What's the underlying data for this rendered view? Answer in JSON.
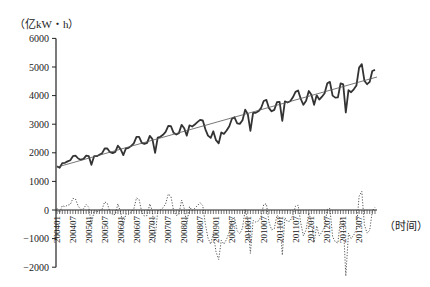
{
  "chart_data": {
    "type": "line",
    "title": "",
    "ylabel": "（亿kW・h）",
    "xlabel": "（时间）",
    "ylim": [
      -2000,
      6000
    ],
    "yticks": [
      6000,
      5000,
      4000,
      3000,
      2000,
      1000,
      0,
      -1000,
      -2000
    ],
    "ytick_labels": [
      "6000",
      "5000",
      "4000",
      "3000",
      "2000",
      "1000",
      "0",
      "−1000",
      "−2000"
    ],
    "x_tick_labels": [
      "200401",
      "200407",
      "200501",
      "200507",
      "200601",
      "200607",
      "200701",
      "200707",
      "200801",
      "200807",
      "200901",
      "200907",
      "201001",
      "201007",
      "201101",
      "201107",
      "201201",
      "201207",
      "201301",
      "201307"
    ],
    "x_start": "2004-01",
    "x_end": "2014-01",
    "grid": false,
    "legend": null,
    "series": [
      {
        "name": "Monthly electricity consumption",
        "style": "solid-thick",
        "values": [
          1530,
          1480,
          1640,
          1650,
          1700,
          1740,
          1880,
          1900,
          1800,
          1760,
          1790,
          1900,
          1880,
          1580,
          1880,
          1880,
          1930,
          1980,
          2150,
          2150,
          2020,
          1990,
          2030,
          2250,
          2130,
          1920,
          2150,
          2170,
          2240,
          2330,
          2560,
          2560,
          2350,
          2310,
          2350,
          2590,
          2480,
          2000,
          2530,
          2560,
          2630,
          2730,
          2940,
          2930,
          2700,
          2640,
          2690,
          2980,
          2860,
          2600,
          2960,
          2920,
          2990,
          3070,
          3150,
          3130,
          2820,
          2600,
          2520,
          2750,
          2440,
          2330,
          2710,
          2660,
          2780,
          2930,
          3190,
          3240,
          3030,
          3010,
          3140,
          3510,
          3350,
          2770,
          3400,
          3400,
          3450,
          3560,
          3810,
          3850,
          3560,
          3450,
          3500,
          3770,
          3780,
          3120,
          3800,
          3760,
          3800,
          3940,
          4130,
          4180,
          3880,
          3680,
          3820,
          4160,
          4030,
          3680,
          4010,
          3860,
          3960,
          4080,
          4430,
          4480,
          4000,
          3930,
          3940,
          4430,
          4390,
          3410,
          4190,
          4120,
          4220,
          4350,
          4980,
          5100,
          4520,
          4400,
          4480,
          4860,
          4900
        ]
      },
      {
        "name": "Linear trend",
        "style": "solid-thin",
        "start": 1500,
        "end": 4650
      },
      {
        "name": "Residual / seasonal component",
        "style": "dotted",
        "values": [
          30,
          -50,
          80,
          60,
          90,
          100,
          210,
          200,
          70,
          10,
          20,
          100,
          50,
          -270,
          -10,
          -30,
          -10,
          10,
          150,
          120,
          -40,
          -90,
          -80,
          110,
          -40,
          -270,
          -70,
          -80,
          -40,
          20,
          220,
          190,
          -40,
          -110,
          -100,
          110,
          -20,
          -520,
          -20,
          0,
          40,
          110,
          290,
          250,
          -10,
          -100,
          -80,
          180,
          30,
          -260,
          60,
          -10,
          30,
          80,
          130,
          80,
          -260,
          -510,
          -620,
          -420,
          -760,
          -900,
          -550,
          -620,
          -530,
          -400,
          -170,
          -140,
          -380,
          -430,
          -330,
          10,
          -180,
          -790,
          -190,
          -220,
          -200,
          -120,
          100,
          110,
          -220,
          -360,
          -340,
          -100,
          -130,
          -820,
          -140,
          -210,
          -200,
          -90,
          70,
          90,
          -240,
          -470,
          -360,
          -50,
          -210,
          -590,
          -290,
          -470,
          -400,
          -310,
          10,
          30,
          -480,
          -580,
          -600,
          -140,
          -190,
          -1200,
          -420,
          -520,
          -450,
          -350,
          250,
          340,
          -270,
          -420,
          -370,
          -20,
          50
        ]
      }
    ]
  }
}
